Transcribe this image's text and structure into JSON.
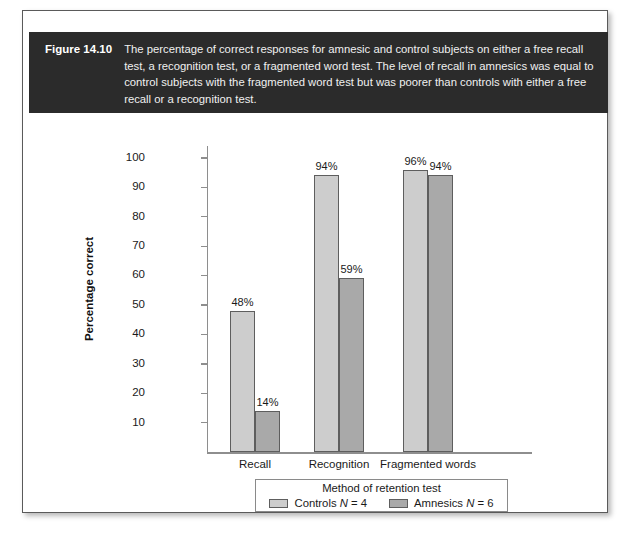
{
  "figure": {
    "label": "Figure 14.10",
    "caption": "The percentage of correct responses for amnesic and control subjects on either a free recall test, a recognition test, or a fragmented word test. The level of recall in amnesics was equal to control subjects with the fragmented word test but was poorer than controls with either a free recall or a recognition test."
  },
  "chart_data": {
    "type": "bar",
    "title": "",
    "xlabel": "Method of retention test",
    "ylabel": "Percentage correct",
    "categories": [
      "Recall",
      "Recognition",
      "Fragmented words"
    ],
    "series": [
      {
        "name": "Controls N = 4",
        "values": [
          48,
          94,
          96
        ],
        "color": "#cdcdcd"
      },
      {
        "name": "Amnesics N = 6",
        "values": [
          14,
          59,
          94
        ],
        "color": "#a9a9a9"
      }
    ],
    "data_labels": [
      [
        "48%",
        "94%",
        "96%"
      ],
      [
        "14%",
        "59%",
        "94%"
      ]
    ],
    "ylim": [
      0,
      100
    ],
    "yticks": [
      10,
      20,
      30,
      40,
      50,
      60,
      70,
      80,
      90,
      100
    ],
    "ytick_labels": [
      "10",
      "20",
      "30",
      "40",
      "50",
      "60",
      "70",
      "80",
      "90",
      "100"
    ],
    "grid": false,
    "legend_position": "bottom"
  },
  "legend": {
    "title": "Method of retention test",
    "entries": [
      {
        "prefix": "Controls ",
        "n": "N",
        "suffix": " = 4"
      },
      {
        "prefix": "Amnesics ",
        "n": "N",
        "suffix": " = 6"
      }
    ]
  },
  "colors": {
    "caption_band": "#2b2b2b",
    "controls_bar": "#cdcdcd",
    "amnesics_bar": "#a9a9a9",
    "axis": "#8e8e8e"
  }
}
